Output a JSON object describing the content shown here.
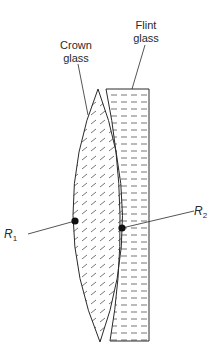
{
  "diagram": {
    "type": "achromatic-doublet-lens",
    "labels": {
      "crown_line1": "Crown",
      "crown_line2": "glass",
      "flint_line1": "Flint",
      "flint_line2": "glass",
      "r1_main": "R",
      "r1_sub": "1",
      "r2_main": "R",
      "r2_sub": "2"
    },
    "colors": {
      "stroke": "#2a2a2a",
      "background": "#ffffff",
      "hatch": "#3a3a3a"
    }
  }
}
